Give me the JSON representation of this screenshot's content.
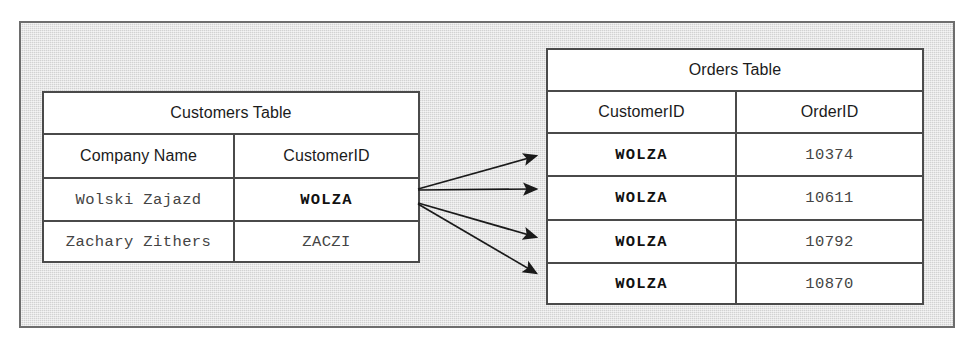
{
  "diagram": {
    "title_alt": "Relationship between Customers Table and Orders Table",
    "background_color": "#d2d2d2",
    "border_color": "#6d6d6d",
    "table_border_color": "#4a4a4a",
    "arrow_color": "#1a1a1a"
  },
  "customers_table": {
    "title": "Customers Table",
    "columns": [
      "Company Name",
      "CustomerID"
    ],
    "rows": [
      {
        "company_name": "Wolski Zajazd",
        "customer_id": "WOLZA",
        "key": true
      },
      {
        "company_name": "Zachary Zithers",
        "customer_id": "ZACZI",
        "key": false
      }
    ]
  },
  "orders_table": {
    "title": "Orders Table",
    "columns": [
      "CustomerID",
      "OrderID"
    ],
    "rows": [
      {
        "customer_id": "WOLZA",
        "order_id": "10374"
      },
      {
        "customer_id": "WOLZA",
        "order_id": "10611"
      },
      {
        "customer_id": "WOLZA",
        "order_id": "10792"
      },
      {
        "customer_id": "WOLZA",
        "order_id": "10870"
      }
    ]
  },
  "relationships": [
    {
      "from": "WOLZA",
      "to": "10374"
    },
    {
      "from": "WOLZA",
      "to": "10611"
    },
    {
      "from": "WOLZA",
      "to": "10792"
    },
    {
      "from": "WOLZA",
      "to": "10870"
    }
  ]
}
